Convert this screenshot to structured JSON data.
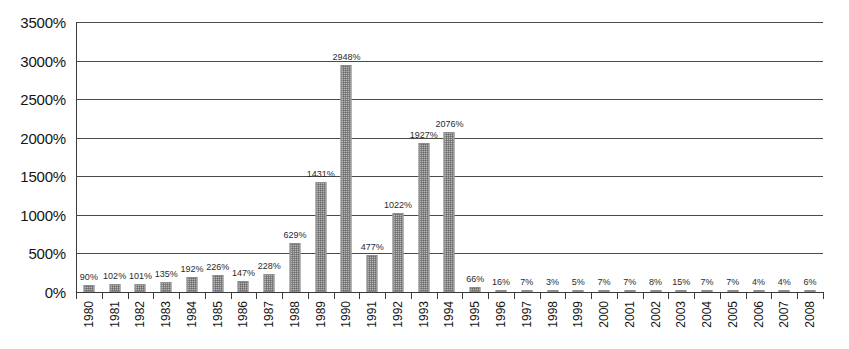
{
  "chart_data": {
    "type": "bar",
    "title": "",
    "subtitle": "",
    "xlabel": "",
    "ylabel": "",
    "ylim": [
      0,
      3500
    ],
    "yticks": [
      0,
      500,
      1000,
      1500,
      2000,
      2500,
      3000,
      3500
    ],
    "ytick_labels": [
      "0%",
      "500%",
      "1000%",
      "1500%",
      "2000%",
      "2500%",
      "3000%",
      "3500%"
    ],
    "grid": true,
    "legend": false,
    "legend_position": "none",
    "value_suffix": "%",
    "bar_color": "#b9b9b9",
    "bar_edge_color": "#8d8d8d",
    "grid_color": "#4a4a4a",
    "axis_color": "#3a3a3a",
    "categories": [
      "1980",
      "1981",
      "1982",
      "1983",
      "1984",
      "1985",
      "1986",
      "1987",
      "1988",
      "1989",
      "1990",
      "1991",
      "1992",
      "1993",
      "1994",
      "1995",
      "1996",
      "1997",
      "1998",
      "1999",
      "2000",
      "2001",
      "2002",
      "2003",
      "2004",
      "2005",
      "2006",
      "2007",
      "2008"
    ],
    "values": [
      90,
      102,
      101,
      135,
      192,
      226,
      147,
      228,
      629,
      1431,
      2948,
      477,
      1022,
      1927,
      2076,
      66,
      16,
      7,
      3,
      5,
      7,
      7,
      8,
      15,
      7,
      7,
      4,
      4,
      6
    ],
    "data_labels": [
      "90%",
      "102%",
      "101%",
      "135%",
      "192%",
      "226%",
      "147%",
      "228%",
      "629%",
      "1431%",
      "2948%",
      "477%",
      "1022%",
      "1927%",
      "2076%",
      "66%",
      "16%",
      "7%",
      "3%",
      "5%",
      "7%",
      "7%",
      "8%",
      "15%",
      "7%",
      "7%",
      "4%",
      "4%",
      "6%"
    ]
  }
}
